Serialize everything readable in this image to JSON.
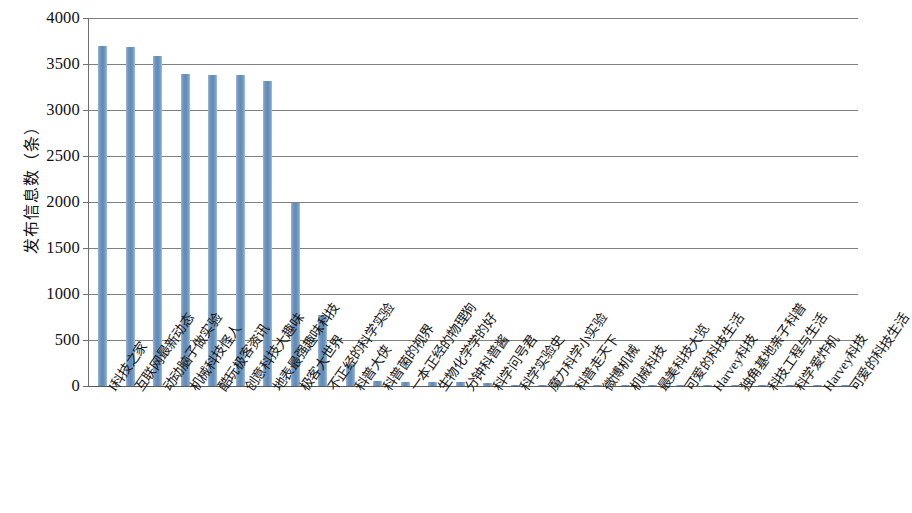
{
  "chart_data": {
    "type": "bar",
    "title": "",
    "xlabel": "",
    "ylabel": "发布信息数（条）",
    "ylim": [
      0,
      4000
    ],
    "grid": true,
    "legend": false,
    "bar_color": "#6f96c0",
    "yticks": [
      0,
      500,
      1000,
      1500,
      2000,
      2500,
      3000,
      3500,
      4000
    ],
    "ytick_labels": [
      "0",
      "500",
      "1000",
      "1500",
      "2000",
      "2500",
      "3000",
      "3500",
      "4000"
    ],
    "categories": [
      "I科技之家",
      "互联网最新动态",
      "动动脑子做实验",
      "机械科技怪人",
      "酷玩极客资讯",
      "创意科技大趣味",
      "地表最强趣味科技",
      "极客大世界",
      "不正经的科学实验",
      "科普大侠",
      "科普菌的视界",
      "一本正经的物理狗",
      "生物化学学的好",
      "分钟科普酱",
      "科学问号君",
      "科学实验史",
      "魔力科学小实验",
      "科普走天下",
      "微博机械",
      "机械科技",
      "最美科技大览",
      "可爱的科技生活",
      "Harvey科技",
      "独角基地亲子科普",
      "科技工程与生活",
      "科学爱炸机",
      "Harvey科技",
      "可爱的科技生活"
    ],
    "values": [
      3700,
      3680,
      3590,
      3395,
      3385,
      3385,
      3320,
      1990,
      770,
      235,
      50,
      45,
      45,
      40,
      30,
      12,
      10,
      8,
      6,
      6,
      5,
      5,
      4,
      4,
      3,
      3,
      2,
      2
    ]
  }
}
